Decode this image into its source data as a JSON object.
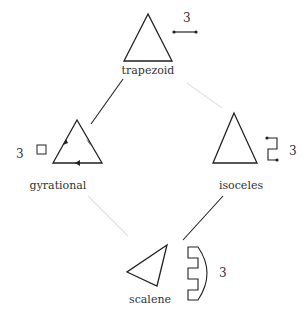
{
  "diagram": {
    "type": "shape-relationship-diagram",
    "colors": {
      "stroke": "#222222",
      "faint_edge": "#e4e4e4",
      "text": "#333333",
      "background": "#ffffff"
    },
    "nodes": [
      {
        "id": "trapezoid",
        "label": "trapezoid",
        "symmetry_count": "3",
        "symbol": "segment-with-endpoints"
      },
      {
        "id": "gyrational",
        "label": "gyrational",
        "symmetry_count": "3",
        "symbol": "square"
      },
      {
        "id": "isoceles",
        "label": "isoceles",
        "symmetry_count": "3",
        "symbol": "zigzag-bracket"
      },
      {
        "id": "scalene",
        "label": "scalene",
        "symmetry_count": "3",
        "symbol": "comb-arc"
      }
    ],
    "edges": [
      {
        "from": "trapezoid",
        "to": "gyrational",
        "style": "dark"
      },
      {
        "from": "trapezoid",
        "to": "isoceles",
        "style": "faint"
      },
      {
        "from": "gyrational",
        "to": "scalene",
        "style": "faint"
      },
      {
        "from": "isoceles",
        "to": "scalene",
        "style": "dark"
      }
    ]
  }
}
